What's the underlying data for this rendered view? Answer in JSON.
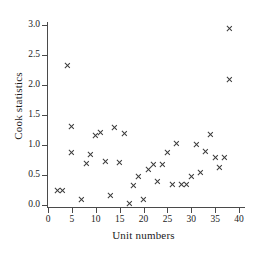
{
  "chart_data": {
    "type": "scatter",
    "title": "",
    "xlabel": "Unit numbers",
    "ylabel": "Cook statistics",
    "xlim": [
      0,
      40
    ],
    "ylim": [
      0.0,
      3.0
    ],
    "grid": false,
    "legend": null,
    "xticks": [
      0,
      5,
      10,
      15,
      20,
      25,
      30,
      35,
      40
    ],
    "xtick_labels": [
      "0",
      "5",
      "10",
      "15",
      "20",
      "25",
      "30",
      "35",
      "40"
    ],
    "yticks": [
      0.0,
      0.5,
      1.0,
      1.5,
      2.0,
      2.5,
      3.0
    ],
    "ytick_labels": [
      "0.0",
      "0.5",
      "1.0",
      "1.5",
      "2.0",
      "2.5",
      "3.0"
    ],
    "marker": "x",
    "marker_color": "#3a3a3a",
    "points": [
      {
        "x": 2,
        "y": 0.24
      },
      {
        "x": 3,
        "y": 0.24
      },
      {
        "x": 4,
        "y": 2.33
      },
      {
        "x": 5,
        "y": 0.88
      },
      {
        "x": 5,
        "y": 1.31
      },
      {
        "x": 7,
        "y": 0.09
      },
      {
        "x": 8,
        "y": 0.7
      },
      {
        "x": 9,
        "y": 0.85
      },
      {
        "x": 10,
        "y": 1.16
      },
      {
        "x": 11,
        "y": 1.21
      },
      {
        "x": 12,
        "y": 0.73
      },
      {
        "x": 13,
        "y": 0.16
      },
      {
        "x": 14,
        "y": 1.29
      },
      {
        "x": 15,
        "y": 0.71
      },
      {
        "x": 16,
        "y": 1.2
      },
      {
        "x": 17,
        "y": 0.03
      },
      {
        "x": 18,
        "y": 0.32
      },
      {
        "x": 19,
        "y": 0.48
      },
      {
        "x": 20,
        "y": 0.1
      },
      {
        "x": 21,
        "y": 0.59
      },
      {
        "x": 22,
        "y": 0.68
      },
      {
        "x": 23,
        "y": 0.39
      },
      {
        "x": 24,
        "y": 0.68
      },
      {
        "x": 25,
        "y": 0.87
      },
      {
        "x": 26,
        "y": 0.34
      },
      {
        "x": 27,
        "y": 1.02
      },
      {
        "x": 28,
        "y": 0.35
      },
      {
        "x": 29,
        "y": 0.35
      },
      {
        "x": 30,
        "y": 0.48
      },
      {
        "x": 31,
        "y": 1.01
      },
      {
        "x": 32,
        "y": 0.55
      },
      {
        "x": 33,
        "y": 0.89
      },
      {
        "x": 34,
        "y": 1.18
      },
      {
        "x": 35,
        "y": 0.8
      },
      {
        "x": 36,
        "y": 0.62
      },
      {
        "x": 37,
        "y": 0.8
      },
      {
        "x": 38,
        "y": 2.95
      },
      {
        "x": 38,
        "y": 2.1
      }
    ]
  }
}
